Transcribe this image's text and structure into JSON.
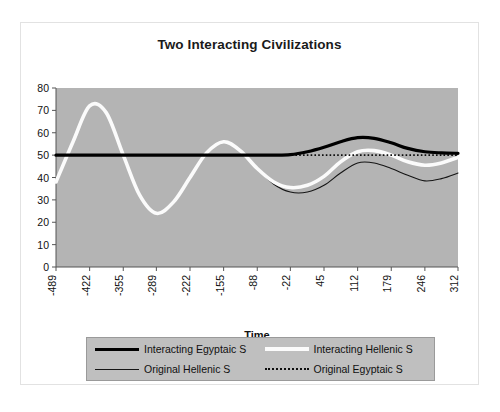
{
  "chart_data": {
    "type": "line",
    "title": "Two Interacting Civilizations",
    "xlabel": "Time",
    "ylabel": "",
    "xlim": [
      -489,
      312
    ],
    "ylim": [
      0,
      80
    ],
    "grid": false,
    "legend_position": "bottom",
    "y_ticks": [
      0,
      10,
      20,
      30,
      40,
      50,
      60,
      70,
      80
    ],
    "x_ticks": [
      -489,
      -422,
      -355,
      -289,
      -222,
      -155,
      -88,
      -22,
      45,
      112,
      179,
      246,
      312
    ],
    "x": [
      -489,
      -455,
      -422,
      -389,
      -355,
      -322,
      -289,
      -255,
      -222,
      -189,
      -155,
      -122,
      -88,
      -55,
      -22,
      12,
      45,
      78,
      112,
      145,
      179,
      212,
      246,
      279,
      312
    ],
    "series": [
      {
        "name": "Interacting Egyptaic S",
        "style": "thick-black",
        "color": "#000000",
        "values": [
          50,
          50,
          50,
          50,
          50,
          50,
          50,
          50,
          50,
          50,
          50,
          50,
          50,
          50,
          50.2,
          51.5,
          53.5,
          56,
          57.8,
          57.5,
          55.5,
          53,
          51.5,
          51,
          50.8
        ]
      },
      {
        "name": "Interacting Hellenic S",
        "style": "thick-white",
        "color": "#fbfbfb",
        "values": [
          38,
          56,
          72,
          69,
          50,
          32,
          24,
          29,
          40,
          51,
          56,
          52,
          44,
          38,
          35.5,
          36.5,
          40.5,
          47,
          51.5,
          52,
          50,
          47,
          45.5,
          46.5,
          49
        ]
      },
      {
        "name": "Original Hellenic S",
        "style": "thin-black",
        "color": "#151515",
        "values": [
          38,
          56,
          72,
          69,
          50,
          32,
          24,
          29,
          40,
          51,
          56,
          52,
          44,
          37,
          33.5,
          33.5,
          36.5,
          42,
          46.5,
          46.5,
          44,
          41,
          38.5,
          39.5,
          42
        ]
      },
      {
        "name": "Original Egyptaic S",
        "style": "dotted-black",
        "color": "#0d0d0d",
        "values": [
          50,
          50,
          50,
          50,
          50,
          50,
          50,
          50,
          50,
          50,
          50,
          50,
          50,
          50,
          50,
          50,
          50,
          50,
          50,
          50,
          50,
          50,
          50,
          50,
          50
        ]
      }
    ],
    "plot_background": "#b4b4b4",
    "chart_background": "#ffffff"
  },
  "legend": {
    "items": [
      {
        "label": "Interacting Egyptaic S",
        "swatch": "sw-thick-black"
      },
      {
        "label": "Interacting Hellenic S",
        "swatch": "sw-thick-white"
      },
      {
        "label": "Original Hellenic S",
        "swatch": "sw-thin-black"
      },
      {
        "label": "Original Egyptaic S",
        "swatch": "sw-dotted-black"
      }
    ]
  }
}
